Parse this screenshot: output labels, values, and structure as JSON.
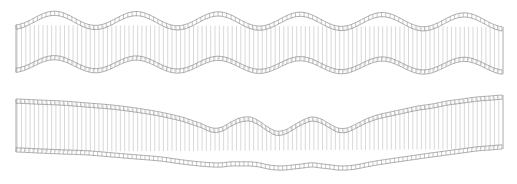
{
  "canvas": {
    "width": 517,
    "height": 184,
    "background": "#ffffff",
    "title": "Wavy mesh bands"
  },
  "style": {
    "hatch_color": "#c4c4c4",
    "rail_color": "#8e8e8e",
    "tick_color": "#9a9a9a",
    "hatch_spacing_px": 4.3,
    "band_thickness_px": 4.2,
    "hatch_stroke_width": 0.65,
    "rail_stroke_width": 0.75
  },
  "shapes": [
    {
      "id": "upper-band",
      "label": "upper-wavy-mesh-band",
      "x_start": 16,
      "x_end": 503,
      "top_edge": {
        "description": "regular sinusoid, six periods",
        "baseline": 18,
        "amplitude": 7.0,
        "period": 82,
        "phase": 0.55,
        "tilt": 0.004
      },
      "bottom_edge": {
        "description": "regular sinusoid, in phase with top edge",
        "baseline": 66,
        "amplitude": 6.4,
        "period": 82,
        "phase": 0.55,
        "tilt": 0.004
      }
    },
    {
      "id": "lower-band",
      "label": "lower-wavy-mesh-band",
      "x_start": 16,
      "x_end": 503,
      "top_edge": {
        "description": "falls left to centre, three tight bumps mid-span, rises to the right",
        "control_points": [
          [
            16,
            99
          ],
          [
            38,
            100
          ],
          [
            62,
            101
          ],
          [
            88,
            103
          ],
          [
            112,
            105
          ],
          [
            136,
            108
          ],
          [
            160,
            112
          ],
          [
            182,
            117
          ],
          [
            200,
            123
          ],
          [
            213,
            128
          ],
          [
            222,
            127
          ],
          [
            231,
            122
          ],
          [
            240,
            118
          ],
          [
            250,
            117
          ],
          [
            259,
            121
          ],
          [
            268,
            127
          ],
          [
            276,
            131
          ],
          [
            285,
            130
          ],
          [
            294,
            125
          ],
          [
            303,
            120
          ],
          [
            312,
            117
          ],
          [
            321,
            119
          ],
          [
            330,
            124
          ],
          [
            338,
            128
          ],
          [
            347,
            128
          ],
          [
            356,
            124
          ],
          [
            366,
            119
          ],
          [
            377,
            115
          ],
          [
            390,
            112
          ],
          [
            404,
            109
          ],
          [
            418,
            106
          ],
          [
            432,
            104
          ],
          [
            447,
            101
          ],
          [
            462,
            99
          ],
          [
            477,
            97
          ],
          [
            490,
            96
          ],
          [
            503,
            95
          ]
        ]
      },
      "bottom_edge": {
        "description": "shallow wave echoing the top edge, lower amplitude",
        "control_points": [
          [
            16,
            152
          ],
          [
            38,
            153
          ],
          [
            62,
            154
          ],
          [
            88,
            155
          ],
          [
            112,
            157
          ],
          [
            136,
            159
          ],
          [
            160,
            161
          ],
          [
            182,
            164
          ],
          [
            200,
            166
          ],
          [
            213,
            167
          ],
          [
            222,
            167
          ],
          [
            231,
            166
          ],
          [
            240,
            166
          ],
          [
            250,
            166
          ],
          [
            259,
            167
          ],
          [
            268,
            169
          ],
          [
            276,
            170
          ],
          [
            285,
            170
          ],
          [
            294,
            169
          ],
          [
            303,
            168
          ],
          [
            312,
            167
          ],
          [
            321,
            168
          ],
          [
            330,
            169
          ],
          [
            338,
            170
          ],
          [
            347,
            170
          ],
          [
            356,
            169
          ],
          [
            366,
            167
          ],
          [
            377,
            165
          ],
          [
            390,
            163
          ],
          [
            404,
            161
          ],
          [
            418,
            159
          ],
          [
            432,
            157
          ],
          [
            447,
            155
          ],
          [
            462,
            153
          ],
          [
            477,
            151
          ],
          [
            490,
            150
          ],
          [
            503,
            149
          ]
        ]
      }
    }
  ]
}
